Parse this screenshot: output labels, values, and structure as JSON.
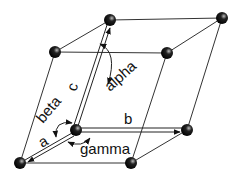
{
  "diagram": {
    "labels": {
      "a": "a",
      "b": "b",
      "c": "c",
      "alpha": "alpha",
      "beta": "beta",
      "gamma": "gamma"
    },
    "atoms": [
      {
        "id": "o",
        "x": 76,
        "y": 130
      },
      {
        "id": "a",
        "x": 20,
        "y": 163
      },
      {
        "id": "b",
        "x": 187,
        "y": 130
      },
      {
        "id": "ab",
        "x": 131,
        "y": 163
      },
      {
        "id": "c",
        "x": 110,
        "y": 20
      },
      {
        "id": "ac",
        "x": 55,
        "y": 52
      },
      {
        "id": "bc",
        "x": 222,
        "y": 18
      },
      {
        "id": "abc",
        "x": 167,
        "y": 53
      }
    ],
    "colors": {
      "atom": "#111111",
      "line": "#333333",
      "background": "#ffffff"
    }
  }
}
